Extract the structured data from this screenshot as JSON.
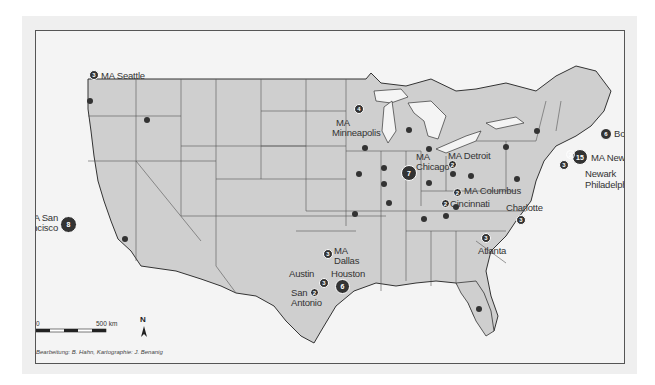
{
  "map": {
    "title": "US city map with MA office markers",
    "colors": {
      "land": "#cfcfcf",
      "water": "#f4f4f4",
      "border": "#555555",
      "marker": "#333333",
      "marker_text": "#ffffff"
    },
    "cities": [
      {
        "label": "MA Seattle",
        "count": "3"
      },
      {
        "label": "MA San Francisco",
        "line1": "MA San",
        "line2": "Francisco",
        "count": "8"
      },
      {
        "label": "MA Minneapolis",
        "line1": "MA",
        "line2": "Minneapolis",
        "count": "4"
      },
      {
        "label": "MA Chicago",
        "line1": "MA",
        "line2": "Chicago",
        "count": "7"
      },
      {
        "label": "MA Detroit",
        "count": "2"
      },
      {
        "label": "MA Columbus",
        "count": "2"
      },
      {
        "label": "Cincinnati",
        "count": "2"
      },
      {
        "label": "Boston",
        "count": "6"
      },
      {
        "label": "MA New York",
        "count": "15"
      },
      {
        "label": "Newark",
        "count": "2"
      },
      {
        "label": "Philadelphia",
        "count": "3"
      },
      {
        "label": "Charlotte",
        "count": "3"
      },
      {
        "label": "Atlanta",
        "count": "3"
      },
      {
        "label": "MA Dallas",
        "line1": "MA",
        "line2": "Dallas",
        "count": "3"
      },
      {
        "label": "Austin",
        "count": "3"
      },
      {
        "label": "Houston",
        "count": "6"
      },
      {
        "label": "San Antonio",
        "line1": "San",
        "line2": "Antonio",
        "count": "2"
      }
    ],
    "scale": {
      "zero": "0",
      "distance": "500 km"
    },
    "north_label": "N",
    "credit": "Bearbeitung: B. Hahn, Kartographie: J. Benanig"
  }
}
